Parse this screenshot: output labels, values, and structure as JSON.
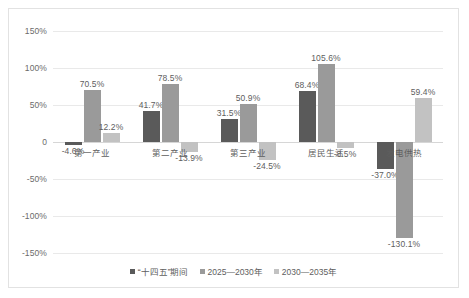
{
  "chart_data": {
    "type": "bar",
    "title": "",
    "subtitle": "",
    "xlabel": "",
    "ylabel": "",
    "grid": true,
    "legend_position": "bottom",
    "categories": [
      "第一产业",
      "第二产业",
      "第三产业",
      "居民生活",
      "发电供热"
    ],
    "ylim": [
      -150,
      150
    ],
    "yticks": [
      150,
      100,
      50,
      0,
      -50,
      -100,
      -150
    ],
    "ytick_labels": [
      "150%",
      "100%",
      "50%",
      "0",
      "-50%",
      "-100%",
      "-150%"
    ],
    "series": [
      {
        "name": "“十四五”期间",
        "color": "#5a5a5a",
        "values": [
          -4.6,
          41.7,
          31.5,
          68.4,
          -37.0
        ],
        "labels": [
          "-4.6%",
          "41.7%",
          "31.5%",
          "68.4%",
          "-37.0%"
        ]
      },
      {
        "name": "2025—2030年",
        "color": "#9a9a9a",
        "values": [
          70.5,
          78.5,
          50.9,
          105.6,
          -130.1
        ],
        "labels": [
          "70.5%",
          "78.5%",
          "50.9%",
          "105.6%",
          "-130.1%"
        ]
      },
      {
        "name": "2030—2035年",
        "color": "#c2c2c2",
        "values": [
          12.2,
          -13.9,
          -24.5,
          -8.5,
          59.4
        ],
        "labels": [
          "12.2%",
          "-13.9%",
          "-24.5%",
          "-8.5%",
          "59.4%"
        ]
      }
    ]
  }
}
